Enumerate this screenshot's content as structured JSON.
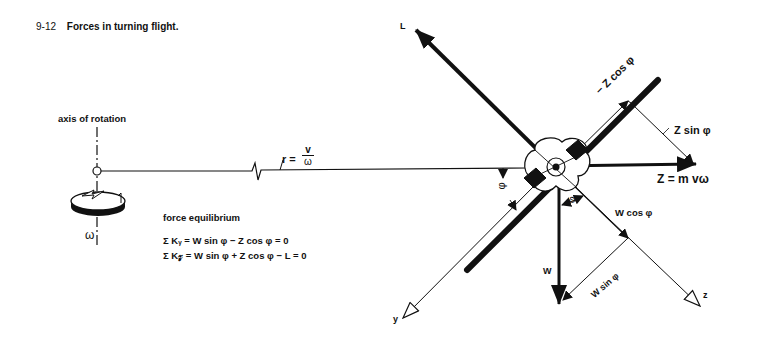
{
  "caption": {
    "number": "9-12",
    "title": "Forces in turning flight."
  },
  "left_panel": {
    "axis_label": "axis of rotation",
    "omega_symbol": "ω",
    "radius_label": "r =",
    "radius_num": "v",
    "radius_den": "ω"
  },
  "equilibrium": {
    "heading": "force equilibrium",
    "equations": [
      "Σ Kᵧ = W sin φ − Z cos φ = 0",
      "Σ K𝓏 = W sin φ + Z cos φ − L = 0"
    ]
  },
  "forces": {
    "lift": "L",
    "centrifugal": "Z = m vω",
    "weight": "W",
    "z_cos": "− Z cos φ",
    "z_sin": "Z sin φ",
    "w_cos": "W cos φ",
    "w_sin": "W sin φ",
    "bank_angle": "φ"
  },
  "axes": {
    "y": "y",
    "z": "z"
  }
}
